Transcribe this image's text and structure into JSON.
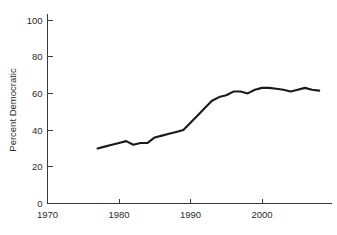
{
  "chart_data": {
    "type": "line",
    "title": "",
    "subtitle": "",
    "xlabel": "",
    "ylabel": "Percent Democratic",
    "xlim": [
      1970,
      2010
    ],
    "ylim": [
      0,
      100
    ],
    "grid": false,
    "legend": null,
    "xticks": [
      1970,
      1980,
      1990,
      2000
    ],
    "xtick_labels": [
      "1970",
      "1980",
      "1990",
      "2000"
    ],
    "yticks": [
      0,
      20,
      40,
      60,
      80,
      100
    ],
    "ytick_labels": [
      "0",
      "20",
      "40",
      "60",
      "80",
      "100"
    ],
    "line_color": "#1a1a1a",
    "series": [
      {
        "name": "Percent Democratic",
        "x": [
          1977,
          1978,
          1979,
          1980,
          1981,
          1982,
          1983,
          1984,
          1985,
          1986,
          1987,
          1988,
          1989,
          1990,
          1991,
          1992,
          1993,
          1994,
          1995,
          1996,
          1997,
          1998,
          1999,
          2000,
          2001,
          2002,
          2003,
          2004,
          2005,
          2006,
          2007,
          2008
        ],
        "values": [
          30,
          31,
          32,
          33,
          34,
          32,
          33,
          33,
          36,
          37,
          38,
          39,
          40,
          44,
          48,
          52,
          56,
          58,
          59,
          61,
          61,
          60,
          62,
          63,
          63,
          62.5,
          62,
          61,
          62,
          63,
          62,
          61.5
        ]
      }
    ]
  },
  "axes": {
    "y_axis_title": "Percent Democratic"
  }
}
